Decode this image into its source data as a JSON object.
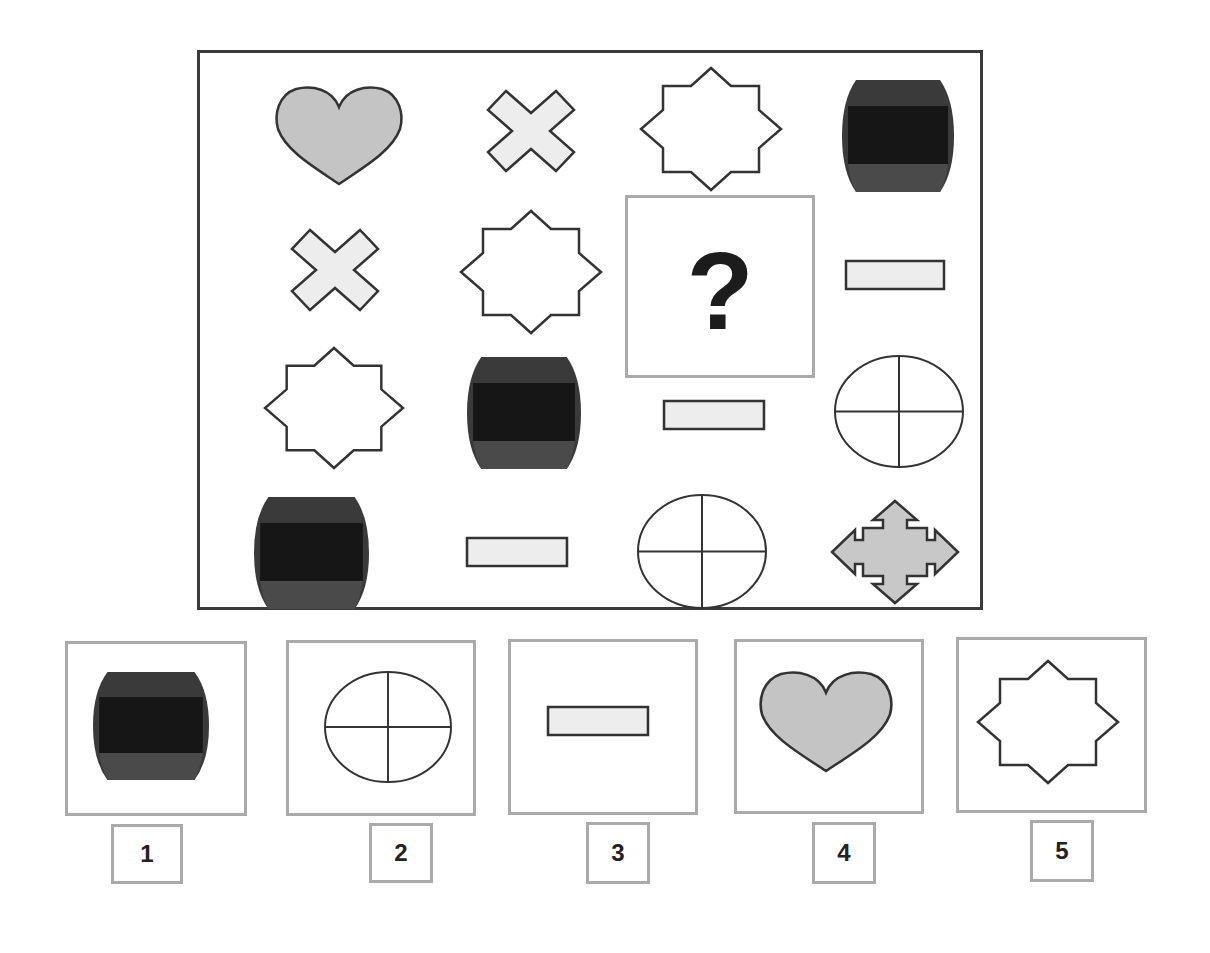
{
  "puzzle": {
    "question_mark": "?",
    "colors": {
      "frame": "#3a3a3a",
      "stroke": "#333333",
      "heart_fill": "#c4c4c4",
      "cross_fill": "#ededed",
      "rect_fill": "#ededed",
      "arrow_fill": "#c8c8c8",
      "barrel_outer": "#3a3a3a",
      "barrel_band": "#161616",
      "barrel_bottom": "#4a4a4a"
    },
    "grid": [
      [
        {
          "shape": "heart",
          "x": 274,
          "y": 85,
          "w": 130,
          "h": 100
        },
        {
          "shape": "cross",
          "x": 487,
          "y": 91,
          "w": 88,
          "h": 80
        },
        {
          "shape": "star8",
          "x": 641,
          "y": 68,
          "w": 140,
          "h": 122
        },
        {
          "shape": "barrel",
          "x": 842,
          "y": 80,
          "w": 112,
          "h": 112
        }
      ],
      [
        {
          "shape": "cross",
          "x": 291,
          "y": 230,
          "w": 88,
          "h": 80
        },
        {
          "shape": "star8",
          "x": 461,
          "y": 211,
          "w": 140,
          "h": 122
        },
        {
          "shape": "question",
          "x": 625,
          "y": 195,
          "w": 190,
          "h": 183
        },
        {
          "shape": "rect",
          "x": 845,
          "y": 260,
          "w": 100,
          "h": 30
        }
      ],
      [
        {
          "shape": "star8",
          "x": 265,
          "y": 348,
          "w": 138,
          "h": 120
        },
        {
          "shape": "barrel",
          "x": 467,
          "y": 357,
          "w": 114,
          "h": 112
        },
        {
          "shape": "rect",
          "x": 663,
          "y": 400,
          "w": 102,
          "h": 30
        },
        {
          "shape": "circle4",
          "x": 834,
          "y": 355,
          "w": 130,
          "h": 113
        }
      ],
      [
        {
          "shape": "barrel",
          "x": 254,
          "y": 497,
          "w": 115,
          "h": 112
        },
        {
          "shape": "rect",
          "x": 466,
          "y": 537,
          "w": 102,
          "h": 30
        },
        {
          "shape": "circle4",
          "x": 637,
          "y": 494,
          "w": 130,
          "h": 115
        },
        {
          "shape": "arrows4",
          "x": 831,
          "y": 500,
          "w": 128,
          "h": 104
        }
      ]
    ]
  },
  "options": [
    {
      "label": "1",
      "shape": "barrel",
      "box": {
        "x": 65,
        "y": 641,
        "w": 182,
        "h": 175
      },
      "shape_box": {
        "x": 93,
        "y": 672,
        "w": 116,
        "h": 108
      },
      "num_box": {
        "x": 111,
        "y": 824,
        "w": 72,
        "h": 60
      }
    },
    {
      "label": "2",
      "shape": "circle4",
      "box": {
        "x": 286,
        "y": 640,
        "w": 190,
        "h": 176
      },
      "shape_box": {
        "x": 324,
        "y": 671,
        "w": 128,
        "h": 112
      },
      "num_box": {
        "x": 369,
        "y": 823,
        "w": 64,
        "h": 60
      }
    },
    {
      "label": "3",
      "shape": "rect",
      "box": {
        "x": 508,
        "y": 639,
        "w": 190,
        "h": 176
      },
      "shape_box": {
        "x": 547,
        "y": 706,
        "w": 102,
        "h": 30
      },
      "num_box": {
        "x": 586,
        "y": 822,
        "w": 64,
        "h": 62
      }
    },
    {
      "label": "4",
      "shape": "heart",
      "box": {
        "x": 734,
        "y": 639,
        "w": 190,
        "h": 175
      },
      "shape_box": {
        "x": 758,
        "y": 670,
        "w": 136,
        "h": 102
      },
      "num_box": {
        "x": 812,
        "y": 822,
        "w": 64,
        "h": 62
      }
    },
    {
      "label": "5",
      "shape": "star8",
      "box": {
        "x": 956,
        "y": 637,
        "w": 191,
        "h": 176
      },
      "shape_box": {
        "x": 978,
        "y": 661,
        "w": 140,
        "h": 122
      },
      "num_box": {
        "x": 1030,
        "y": 820,
        "w": 64,
        "h": 62
      }
    }
  ]
}
